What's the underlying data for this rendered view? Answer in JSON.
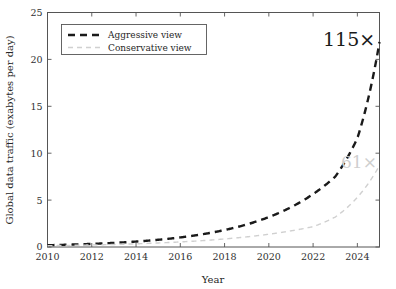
{
  "chart_data": {
    "type": "line",
    "title": "",
    "xlabel": "Year",
    "ylabel": "Global data traffic (exabytes per day)",
    "xlim": [
      2010,
      2025
    ],
    "ylim": [
      0,
      25
    ],
    "xticks": [
      "2010",
      "2012",
      "2014",
      "2016",
      "2018",
      "2020",
      "2022",
      "2024"
    ],
    "xtick_values": [
      2010,
      2012,
      2014,
      2016,
      2018,
      2020,
      2022,
      2024
    ],
    "yticks": [
      "0",
      "5",
      "10",
      "15",
      "20",
      "25"
    ],
    "ytick_values": [
      0,
      5,
      10,
      15,
      20,
      25
    ],
    "grid": false,
    "legend_position": "upper left",
    "x": [
      2010,
      2011,
      2012,
      2013,
      2014,
      2015,
      2016,
      2017,
      2018,
      2019,
      2020,
      2021,
      2022,
      2023,
      2024,
      2025
    ],
    "series": [
      {
        "name": "Aggressive view",
        "color": "#1a1a1a",
        "linestyle": "dashed",
        "linewidth": 2.4,
        "values": [
          0.19,
          0.25,
          0.33,
          0.44,
          0.58,
          0.77,
          1.02,
          1.36,
          1.81,
          2.4,
          3.19,
          4.24,
          5.64,
          7.5,
          11.6,
          21.85
        ]
      },
      {
        "name": "Conservative view",
        "color": "#d0d0d0",
        "linestyle": "dashed",
        "linewidth": 1.4,
        "values": [
          0.14,
          0.17,
          0.22,
          0.27,
          0.34,
          0.43,
          0.54,
          0.68,
          0.86,
          1.08,
          1.36,
          1.72,
          2.17,
          3.2,
          5.3,
          8.7
        ]
      }
    ],
    "annotations": [
      {
        "text": "115×",
        "series": "Aggressive view",
        "color": "#1a1a1a",
        "x_px": 323,
        "y_px": 46
      },
      {
        "text": "61×",
        "series": "Conservative view",
        "color": "#cfcfcf",
        "x_px": 341,
        "y_px": 168
      }
    ],
    "legend_entries": [
      {
        "label": "Aggressive view",
        "color": "#1a1a1a",
        "linestyle": "dashed"
      },
      {
        "label": "Conservative view",
        "color": "#d0d0d0",
        "linestyle": "dashed"
      }
    ]
  }
}
